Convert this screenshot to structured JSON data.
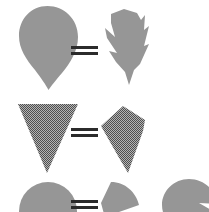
{
  "figure": {
    "background_color": "#ffffff",
    "width": 209,
    "height": 212
  },
  "palette": {
    "solid_gray": "#969696",
    "dither_dark_gray": "#6f6f6f",
    "dither_light_gray": "#b4b4b4",
    "ink_black": "#2b2b2b"
  },
  "rows": [
    {
      "id": "row-1",
      "left_shape": {
        "name": "teardrop-leaf-entire",
        "label": "entire teardrop leaf",
        "fill": "#969696",
        "texture": "solid"
      },
      "operator": {
        "name": "equals-sign",
        "symbol": "="
      },
      "right_shapes": [
        {
          "name": "teardrop-leaf-lobed",
          "label": "lobed teardrop leaf",
          "fill": "#969696",
          "texture": "solid"
        }
      ],
      "alternative_label": ""
    },
    {
      "id": "row-2",
      "left_shape": {
        "name": "inverted-triangle-entire",
        "label": "inverted triangle leaf",
        "fill": "#6f6f6f",
        "texture": "dither"
      },
      "operator": {
        "name": "equals-sign",
        "symbol": "="
      },
      "right_shapes": [
        {
          "name": "kite-pentagon-leaf",
          "label": "kite shaped leaf",
          "fill": "#6f6f6f",
          "texture": "dither"
        }
      ],
      "alternative_label": ""
    },
    {
      "id": "row-3",
      "left_shape": {
        "name": "round-disc-leaf",
        "label": "round disc leaf",
        "fill": "#969696",
        "texture": "solid"
      },
      "operator": {
        "name": "equals-sign",
        "symbol": "="
      },
      "right_shapes": [
        {
          "name": "notched-wedge-leaf",
          "label": "notched wedge leaf",
          "fill": "#969696",
          "texture": "solid"
        },
        {
          "name": "notched-disc-leaf",
          "label": "notched disc leaf",
          "fill": "#969696",
          "texture": "solid"
        }
      ],
      "alternative_label": "or"
    }
  ]
}
